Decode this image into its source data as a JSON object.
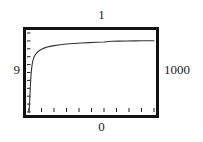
{
  "chart_data": {
    "type": "line",
    "title": "1",
    "xlabel": "0",
    "ylabel": "9",
    "right_label": "1000",
    "grid": false,
    "legend": null,
    "xlim": [
      0,
      1000
    ],
    "ylim": [
      0,
      1
    ],
    "axis_labels": {
      "top": "1",
      "left": "9",
      "right": "1000",
      "bottom": "0"
    },
    "x_ticks": [
      0,
      100,
      200,
      300,
      400,
      500,
      600,
      700,
      800,
      900,
      1000
    ],
    "x_tick_labels": [
      "",
      "",
      "",
      "",
      "",
      "",
      "",
      "",
      "",
      "",
      ""
    ],
    "y_ticks": [
      0,
      0.1,
      0.2,
      0.3,
      0.4,
      0.5,
      0.6,
      0.7,
      0.8,
      0.9,
      1.0
    ],
    "y_tick_labels": [
      "",
      "",
      "",
      "",
      "",
      "",
      "",
      "",
      "",
      "",
      ""
    ],
    "series": [
      {
        "name": "saturating-curve",
        "color": "#333333",
        "x": [
          0,
          5,
          10,
          15,
          20,
          25,
          30,
          40,
          50,
          65,
          80,
          100,
          130,
          160,
          200,
          250,
          300,
          360,
          420,
          480,
          540,
          600,
          660,
          720,
          780,
          840,
          900,
          960,
          1000
        ],
        "y": [
          0.0,
          0.12,
          0.3,
          0.44,
          0.54,
          0.6,
          0.645,
          0.695,
          0.725,
          0.755,
          0.775,
          0.795,
          0.815,
          0.828,
          0.84,
          0.852,
          0.86,
          0.868,
          0.874,
          0.878,
          0.882,
          0.886,
          0.895,
          0.897,
          0.899,
          0.9,
          0.901,
          0.902,
          0.902
        ]
      }
    ]
  }
}
